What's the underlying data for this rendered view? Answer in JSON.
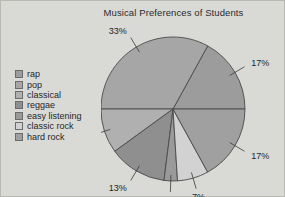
{
  "chart_data": {
    "type": "pie",
    "title": "Musical Preferences of Students",
    "categories": [
      "rap",
      "pop",
      "classical",
      "reggae",
      "easy listening",
      "classic rock",
      "hard rock"
    ],
    "values": [
      17,
      33,
      10,
      13,
      3,
      7,
      17
    ],
    "value_labels": [
      "17%",
      "33%",
      "10%",
      "13%",
      "3%",
      "7%",
      "17%"
    ],
    "unit": "%",
    "total": 100,
    "legend_position": "left",
    "grid": false,
    "colors": [
      "#9c9c9c",
      "#a6a6a6",
      "#b0b0b0",
      "#8f8f8f",
      "#9a9a9a",
      "#d2d2d2",
      "#a0a0a0"
    ],
    "slices": [
      {
        "label": "rap",
        "value": 17,
        "value_label": "17%",
        "color": "#9c9c9c"
      },
      {
        "label": "pop",
        "value": 33,
        "value_label": "33%",
        "color": "#a6a6a6"
      },
      {
        "label": "classical",
        "value": 10,
        "value_label": "10%",
        "color": "#b0b0b0"
      },
      {
        "label": "reggae",
        "value": 13,
        "value_label": "13%",
        "color": "#8f8f8f"
      },
      {
        "label": "easy listening",
        "value": 3,
        "value_label": "3%",
        "color": "#9a9a9a"
      },
      {
        "label": "classic rock",
        "value": 7,
        "value_label": "7%",
        "color": "#d2d2d2"
      },
      {
        "label": "hard rock",
        "value": 17,
        "value_label": "17%",
        "color": "#a0a0a0"
      }
    ]
  },
  "legend": {
    "items": [
      {
        "label": "rap",
        "color": "#9c9c9c"
      },
      {
        "label": "pop",
        "color": "#a6a6a6"
      },
      {
        "label": "classical",
        "color": "#b0b0b0"
      },
      {
        "label": "reggae",
        "color": "#8f8f8f"
      },
      {
        "label": "easy listening",
        "color": "#9a9a9a"
      },
      {
        "label": "classic rock",
        "color": "#d2d2d2"
      },
      {
        "label": "hard rock",
        "color": "#a0a0a0"
      }
    ]
  },
  "labels": {
    "top": "17%",
    "right": "17%",
    "bottom_right": "33%",
    "bottom_left": "10%",
    "left": "13%",
    "upper_left_inner": "3%",
    "upper_left_outer": "7%"
  }
}
